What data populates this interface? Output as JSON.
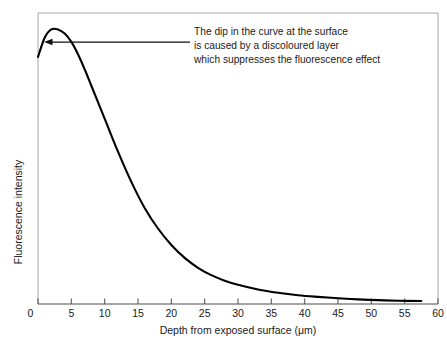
{
  "chart_data": {
    "type": "line",
    "title": "",
    "xlabel": "Depth from exposed surface (μm)",
    "ylabel": "Fluorescence intensity",
    "xlim": [
      0,
      60
    ],
    "ylim": [
      0,
      1.06
    ],
    "grid": false,
    "legend": null,
    "xticks": [
      "0",
      "5",
      "10",
      "15",
      "20",
      "25",
      "30",
      "35",
      "40",
      "45",
      "50",
      "55",
      "60"
    ],
    "xtick_values": [
      0,
      5,
      10,
      15,
      20,
      25,
      30,
      35,
      40,
      45,
      50,
      55,
      60
    ],
    "yticks": [],
    "series": [
      {
        "name": "Fluorescence intensity vs depth",
        "color": "#000000",
        "x": [
          0,
          1,
          2,
          3,
          4,
          5,
          6,
          7,
          8,
          9,
          10,
          12,
          14,
          16,
          18,
          20,
          22,
          24,
          26,
          28,
          30,
          33,
          36,
          39,
          42,
          45,
          48,
          51,
          54,
          57.5
        ],
        "y": [
          0.9,
          0.97,
          1.0,
          1.0,
          0.985,
          0.955,
          0.91,
          0.855,
          0.795,
          0.735,
          0.675,
          0.555,
          0.445,
          0.35,
          0.275,
          0.215,
          0.168,
          0.132,
          0.105,
          0.085,
          0.07,
          0.053,
          0.041,
          0.032,
          0.026,
          0.021,
          0.017,
          0.014,
          0.012,
          0.011
        ]
      }
    ],
    "annotations": [
      {
        "name": "dip-callout",
        "lines": [
          "The dip in the curve at the surface",
          "is caused by a discoloured layer",
          "which suppresses the  fluorescence effect"
        ],
        "arrow": {
          "from_x": 9.8,
          "from_y": 0.895,
          "to_x": 1.2,
          "to_y": 0.895,
          "direction": "left"
        }
      }
    ]
  },
  "axis_label_x": "Depth from exposed surface (μm)",
  "axis_label_y": "Fluorescence intensity",
  "annotation_text": {
    "line1": "The dip in the curve at the surface",
    "line2": "is caused by a discoloured layer",
    "line3": "which suppresses the  fluorescence effect"
  },
  "xtick_labels": {
    "t0": "0",
    "t1": "5",
    "t2": "10",
    "t3": "15",
    "t4": "20",
    "t5": "25",
    "t6": "30",
    "t7": "35",
    "t8": "40",
    "t9": "45",
    "t10": "50",
    "t11": "55",
    "t12": "60"
  },
  "colors": {
    "curve": "#000000",
    "frame": "#9a9a9a",
    "axis": "#555555",
    "text": "#1a1a1a",
    "background": "#ffffff"
  }
}
